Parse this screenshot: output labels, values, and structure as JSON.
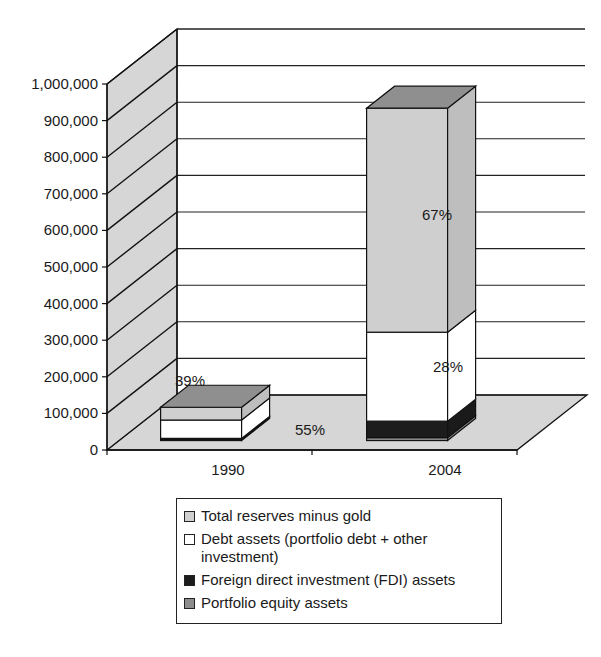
{
  "chart_data": {
    "type": "bar",
    "subtype": "stacked-3d",
    "title": "",
    "xlabel": "",
    "ylabel": "",
    "categories": [
      "1990",
      "2004"
    ],
    "ylim": [
      0,
      1000000
    ],
    "yticks": [
      0,
      100000,
      200000,
      300000,
      400000,
      500000,
      600000,
      700000,
      800000,
      900000,
      1000000
    ],
    "ytick_labels": [
      "0",
      "100,000",
      "200,000",
      "300,000",
      "400,000",
      "500,000",
      "600,000",
      "700,000",
      "800,000",
      "900,000",
      "1,000,000"
    ],
    "grid": true,
    "legend_position": "bottom",
    "series": [
      {
        "name": "Portfolio equity assets",
        "color": "#8c8c8c",
        "values": [
          3000,
          8000
        ]
      },
      {
        "name": "Foreign direct investment (FDI) assets",
        "color": "#1c1c1c",
        "values": [
          3000,
          45000
        ]
      },
      {
        "name": "Debt assets (portfolio debt + other investment)",
        "color": "#ffffff",
        "values": [
          50000,
          243000
        ]
      },
      {
        "name": "Total reserves minus gold",
        "color": "#cfcfcf",
        "values": [
          35000,
          612000
        ]
      }
    ],
    "legend_order": [
      {
        "name": "Total reserves minus gold",
        "color": "#cfcfcf"
      },
      {
        "name": "Debt assets (portfolio debt + other investment)",
        "color": "#ffffff"
      },
      {
        "name": "Foreign direct investment (FDI) assets",
        "color": "#1c1c1c"
      },
      {
        "name": "Portfolio equity assets",
        "color": "#8c8c8c"
      }
    ],
    "annotations": [
      {
        "category": "1990",
        "series": "Total reserves minus gold",
        "text": "39%"
      },
      {
        "category": "1990",
        "series": "Debt assets (portfolio debt + other investment)",
        "text": "55%"
      },
      {
        "category": "2004",
        "series": "Total reserves minus gold",
        "text": "67%"
      },
      {
        "category": "2004",
        "series": "Debt assets (portfolio debt + other investment)",
        "text": "28%"
      }
    ],
    "wall_color": "#d6d6d6",
    "floor_color": "#d6d6d6"
  }
}
